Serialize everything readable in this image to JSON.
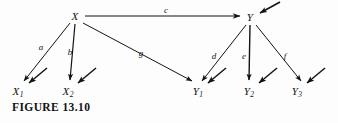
{
  "figure": {
    "caption": "FIGURE 13.10",
    "background_color": "#fdfdfd",
    "ink_color": "#141414"
  },
  "nodes": [
    {
      "id": "X",
      "label": "X",
      "sub": "",
      "x": 75,
      "y": 16
    },
    {
      "id": "Y",
      "label": "Y",
      "sub": "",
      "x": 250,
      "y": 17
    },
    {
      "id": "X1",
      "label": "X",
      "sub": "1",
      "x": 18,
      "y": 92
    },
    {
      "id": "X2",
      "label": "X",
      "sub": "2",
      "x": 68,
      "y": 92
    },
    {
      "id": "Y1",
      "label": "Y",
      "sub": "1",
      "x": 198,
      "y": 92
    },
    {
      "id": "Y2",
      "label": "Y",
      "sub": "2",
      "x": 249,
      "y": 92
    },
    {
      "id": "Y3",
      "label": "Y",
      "sub": "3",
      "x": 297,
      "y": 92
    }
  ],
  "edges": [
    {
      "id": "a",
      "label": "a",
      "from": "X",
      "to": "X1",
      "label_x": 41,
      "label_y": 47
    },
    {
      "id": "b",
      "label": "b",
      "from": "X",
      "to": "X2",
      "label_x": 70,
      "label_y": 52
    },
    {
      "id": "c",
      "label": "c",
      "from": "X",
      "to": "Y",
      "label_x": 166,
      "label_y": 10
    },
    {
      "id": "g",
      "label": "g",
      "from": "X",
      "to": "Y1",
      "label_x": 141,
      "label_y": 53
    },
    {
      "id": "d",
      "label": "d",
      "from": "Y",
      "to": "Y1",
      "label_x": 214,
      "label_y": 56
    },
    {
      "id": "e",
      "label": "e",
      "from": "Y",
      "to": "Y2",
      "label_x": 244,
      "label_y": 56
    },
    {
      "id": "f",
      "label": "f",
      "from": "Y",
      "to": "Y3",
      "label_x": 285,
      "label_y": 56
    }
  ],
  "disturbances": [
    {
      "target": "Y",
      "tail_x": 280,
      "tail_y": 2,
      "head_x": 260,
      "head_y": 13
    },
    {
      "target": "X1",
      "tail_x": 47,
      "tail_y": 68,
      "head_x": 29,
      "head_y": 83
    },
    {
      "target": "X2",
      "tail_x": 96,
      "tail_y": 68,
      "head_x": 78,
      "head_y": 83
    },
    {
      "target": "Y1",
      "tail_x": 226,
      "tail_y": 68,
      "head_x": 208,
      "head_y": 83
    },
    {
      "target": "Y2",
      "tail_x": 277,
      "tail_y": 68,
      "head_x": 259,
      "head_y": 83
    },
    {
      "target": "Y3",
      "tail_x": 325,
      "tail_y": 68,
      "head_x": 307,
      "head_y": 83
    }
  ]
}
